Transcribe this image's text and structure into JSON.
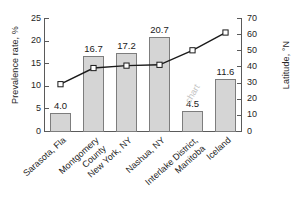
{
  "chart_data": {
    "type": "bar",
    "title": "",
    "categories": [
      "Sarasota, Fla",
      "Montgomery County",
      "New York, NY",
      "Nashua, NY",
      "Interlake District, Manitoba",
      "Iceland"
    ],
    "category_lines": [
      [
        "Sarasota, Fla"
      ],
      [
        "Montgomery",
        "County"
      ],
      [
        "New York, NY"
      ],
      [
        "Nashua, NY"
      ],
      [
        "Interlake District,",
        "Manitoba"
      ],
      [
        "Iceland"
      ]
    ],
    "series": [
      {
        "name": "Prevalence rate",
        "type": "bar",
        "axis": "left",
        "unit": "%",
        "values": [
          4.0,
          16.7,
          17.2,
          20.7,
          4.5,
          11.6
        ],
        "labels": [
          "4.0",
          "16.7",
          "17.2",
          "20.7",
          "4.5",
          "11.6"
        ],
        "fill_color": "#d5d5d5",
        "edge_color": "#7d7d7d"
      },
      {
        "name": "Latitude",
        "type": "line",
        "axis": "right",
        "unit": "°N",
        "values": [
          29,
          39,
          40.5,
          41,
          50,
          61
        ],
        "line_color": "#1a1a1a",
        "marker": "square",
        "marker_fill": "#ffffff"
      }
    ],
    "xlabel": "",
    "ylabel": "Prevalence rate, %",
    "ylabel_right": "Latitude, °N",
    "ylim": [
      0,
      25
    ],
    "ylim_right": [
      0,
      70
    ],
    "yticks": [
      0,
      5,
      10,
      15,
      20,
      25
    ],
    "yticks_right": [
      0,
      10,
      20,
      30,
      40,
      50,
      60,
      70
    ],
    "ytick_labels": [
      "0",
      "5",
      "10",
      "15",
      "20",
      "25"
    ],
    "ytick_labels_right": [
      "0",
      "10",
      "20",
      "30",
      "40",
      "50",
      "60",
      "70"
    ],
    "grid": false,
    "legend": "none"
  },
  "watermark": {
    "text": "chart"
  }
}
